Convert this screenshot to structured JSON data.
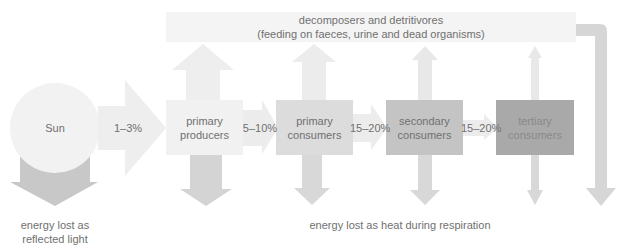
{
  "diagram": {
    "type": "energy-flow-food-chain",
    "decomposers": {
      "line1": "decomposers and detritivores",
      "line2": "(feeding on faeces, urine and dead organisms)"
    },
    "sun": {
      "label": "Sun"
    },
    "nodes": [
      {
        "id": "primary-producers",
        "line1": "primary",
        "line2": "producers",
        "color": "#f1f1f1"
      },
      {
        "id": "primary-consumers",
        "line1": "primary",
        "line2": "consumers",
        "color": "#dcdcdc"
      },
      {
        "id": "secondary-consumers",
        "line1": "secondary",
        "line2": "consumers",
        "color": "#c4c4c4"
      },
      {
        "id": "tertiary-consumers",
        "line1": "tertiary",
        "line2": "consumers",
        "color": "#a9a9a9"
      }
    ],
    "transfers": [
      "1–3%",
      "5–10%",
      "15–20%",
      "15–20%"
    ],
    "captions": {
      "reflected_line1": "energy lost as",
      "reflected_line2": "reflected light",
      "respiration": "energy lost as heat during respiration"
    },
    "colors": {
      "sun": "#f2f2f2",
      "reflected_arrow": "#c8c8c8",
      "light_arrow": "#eeeeee",
      "decomposer_box": "#f4f4f4",
      "return_arrow": "#d6d6d6",
      "text": "#707070"
    }
  }
}
